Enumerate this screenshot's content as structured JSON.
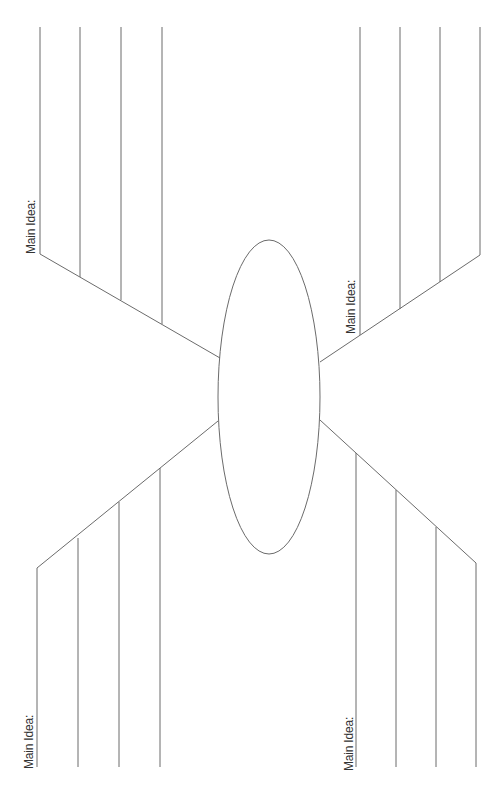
{
  "document": {
    "type": "graphic-organizer",
    "stroke_color": "#6b6b6b",
    "background": "#ffffff"
  },
  "center_oval": {
    "cx": 269,
    "cy": 397,
    "rx": 51,
    "ry": 157
  },
  "branches": [
    {
      "id": "top-left",
      "label": "Main Idea:",
      "diagonal": [
        [
          40,
          254
        ],
        [
          220,
          358
        ]
      ],
      "lines": [
        {
          "x": 40,
          "y1": 27,
          "y2": 254
        },
        {
          "x": 80,
          "y1": 27,
          "y2": 277
        },
        {
          "x": 121,
          "y1": 27,
          "y2": 300
        },
        {
          "x": 162,
          "y1": 27,
          "y2": 324
        }
      ]
    },
    {
      "id": "top-right",
      "label": "Main Idea:",
      "diagonal": [
        [
          480,
          255
        ],
        [
          320,
          362
        ]
      ],
      "lines": [
        {
          "x": 360,
          "y1": 27,
          "y2": 335
        },
        {
          "x": 400,
          "y1": 27,
          "y2": 309
        },
        {
          "x": 440,
          "y1": 27,
          "y2": 282
        },
        {
          "x": 480,
          "y1": 27,
          "y2": 255
        }
      ]
    },
    {
      "id": "bottom-left",
      "label": "Main Idea:",
      "diagonal": [
        [
          37,
          568
        ],
        [
          218,
          421
        ]
      ],
      "lines": [
        {
          "x": 37,
          "y1": 568,
          "y2": 767
        },
        {
          "x": 78,
          "y1": 538,
          "y2": 767
        },
        {
          "x": 119,
          "y1": 502,
          "y2": 767
        },
        {
          "x": 160,
          "y1": 468,
          "y2": 767
        }
      ]
    },
    {
      "id": "bottom-right",
      "label": "Main Idea:",
      "diagonal": [
        [
          320,
          420
        ],
        [
          476,
          563
        ]
      ],
      "lines": [
        {
          "x": 356,
          "y1": 453,
          "y2": 767
        },
        {
          "x": 396,
          "y1": 490,
          "y2": 767
        },
        {
          "x": 436,
          "y1": 527,
          "y2": 767
        },
        {
          "x": 476,
          "y1": 563,
          "y2": 767
        }
      ]
    }
  ],
  "labels": [
    {
      "text": "Main Idea:",
      "left": 25,
      "top": 254
    },
    {
      "text": "Main Idea:",
      "left": 345,
      "top": 334
    },
    {
      "text": "Main Idea:",
      "left": 23,
      "top": 769
    },
    {
      "text": "Main Idea:",
      "left": 343,
      "top": 771
    }
  ]
}
